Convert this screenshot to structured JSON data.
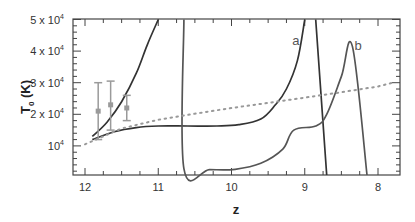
{
  "chart_data": {
    "type": "line",
    "title": "",
    "xlabel": "z",
    "ylabel": "T",
    "ylabel_subscript": "0",
    "ylabel_unit": " (K)",
    "xlim": [
      12.15,
      7.8
    ],
    "ylim": [
      0,
      50000
    ],
    "x_reversed": true,
    "grid": false,
    "x_ticks": [
      {
        "value": 12,
        "label": "12"
      },
      {
        "value": 11,
        "label": "11"
      },
      {
        "value": 10,
        "label": "10"
      },
      {
        "value": 9,
        "label": "9"
      },
      {
        "value": 8,
        "label": "8"
      }
    ],
    "y_ticks": [
      {
        "value": 10000,
        "label": "10",
        "exp": "4"
      },
      {
        "value": 20000,
        "label": "2 x 10",
        "exp": "4"
      },
      {
        "value": 30000,
        "label": "3 x 10",
        "exp": "4"
      },
      {
        "value": 40000,
        "label": "4 x 10",
        "exp": "4"
      },
      {
        "value": 50000,
        "label": "5 x 10",
        "exp": "4"
      }
    ],
    "series": [
      {
        "name": "steep-early",
        "style": "solid",
        "color": "#333333",
        "x": [
          11.9,
          11.7,
          11.5,
          11.3,
          11.15,
          11.0
        ],
        "y": [
          13000,
          17500,
          24000,
          33000,
          42000,
          50000
        ]
      },
      {
        "name": "a",
        "label": "a",
        "style": "solid",
        "color": "#333333",
        "x": [
          11.9,
          11.6,
          11.3,
          11.0,
          10.6,
          10.2,
          9.9,
          9.6,
          9.4,
          9.25,
          9.1,
          9.0
        ],
        "y": [
          12000,
          14500,
          15800,
          16300,
          16300,
          16300,
          16700,
          18500,
          23000,
          28000,
          37000,
          50000
        ]
      },
      {
        "name": "a-descent",
        "style": "solid",
        "color": "#333333",
        "x": [
          8.85,
          8.7
        ],
        "y": [
          50000,
          0
        ]
      },
      {
        "name": "b",
        "label": "b",
        "style": "solid",
        "color": "#555555",
        "x": [
          10.65,
          10.65,
          10.3,
          9.95,
          9.6,
          9.3,
          9.15,
          8.85,
          8.7,
          8.5,
          8.35,
          8.15
        ],
        "y": [
          50000,
          2800,
          2500,
          2600,
          4500,
          9000,
          15000,
          16300,
          20000,
          32000,
          41500,
          0
        ]
      },
      {
        "name": "dotted-reference",
        "style": "dotted",
        "color": "#999999",
        "x": [
          12.0,
          11.5,
          11.0,
          10.5,
          10.0,
          9.5,
          9.0,
          8.5,
          8.0,
          7.8
        ],
        "y": [
          10500,
          15500,
          18300,
          20200,
          22000,
          23600,
          25300,
          27000,
          28800,
          30000
        ]
      }
    ],
    "error_bars": [
      {
        "x": 11.82,
        "y": 21000,
        "ylow": 12000,
        "yhigh": 30000
      },
      {
        "x": 11.65,
        "y": 23000,
        "ylow": 15000,
        "yhigh": 30500
      },
      {
        "x": 11.43,
        "y": 22000,
        "ylow": 18000,
        "yhigh": 26000
      }
    ],
    "annotations": [
      {
        "text": "a",
        "x": 9.17,
        "y": 42000
      },
      {
        "text": "b",
        "x": 8.32,
        "y": 40500
      }
    ]
  }
}
